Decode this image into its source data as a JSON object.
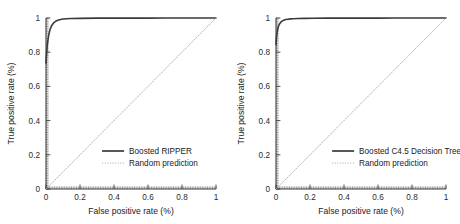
{
  "figure": {
    "background": "#ffffff",
    "panel_count": 2
  },
  "chart_data": [
    {
      "type": "line",
      "panel": "left",
      "title": "",
      "xlabel": "False positive rate (%)",
      "ylabel": "True positive rate (%)",
      "xlim": [
        0,
        1
      ],
      "ylim": [
        0,
        1
      ],
      "xticks": [
        0,
        0.2,
        0.4,
        0.6,
        0.8,
        1
      ],
      "xticklabels": [
        "0",
        "0.2",
        "0.4",
        "0.6",
        "0.8",
        "1"
      ],
      "yticks": [
        0,
        0.2,
        0.4,
        0.6,
        0.8,
        1
      ],
      "yticklabels": [
        "0",
        "0.2",
        "0.4",
        "0.6",
        "0.8",
        "1"
      ],
      "grid": false,
      "minor_ticks": true,
      "legend_position": "lower right",
      "series": [
        {
          "name": "Boosted RIPPER",
          "style": "solid",
          "color": "#3a3a3a",
          "linewidth": 1.6,
          "x": [
            0,
            0.004,
            0.008,
            0.012,
            0.016,
            0.02,
            0.025,
            0.03,
            0.035,
            0.042,
            0.05,
            0.06,
            0.07,
            0.08,
            0.1,
            0.12,
            0.15,
            0.2,
            0.3,
            0.4,
            0.5,
            0.6,
            0.7,
            0.8,
            0.9,
            1.0
          ],
          "y": [
            0.735,
            0.8,
            0.845,
            0.875,
            0.9,
            0.918,
            0.935,
            0.948,
            0.958,
            0.968,
            0.976,
            0.983,
            0.987,
            0.99,
            0.994,
            0.996,
            0.997,
            0.998,
            0.999,
            0.999,
            0.9995,
            0.9995,
            1.0,
            1.0,
            1.0,
            1.0
          ]
        },
        {
          "name": "Random prediction",
          "style": "dotted",
          "color": "#a8a8a8",
          "linewidth": 0.9,
          "x": [
            0,
            1
          ],
          "y": [
            0,
            1
          ]
        }
      ]
    },
    {
      "type": "line",
      "panel": "right",
      "title": "",
      "xlabel": "False positive rate (%)",
      "ylabel": "True positive rate (%)",
      "xlim": [
        0,
        1
      ],
      "ylim": [
        0,
        1
      ],
      "xticks": [
        0,
        0.2,
        0.4,
        0.6,
        0.8,
        1
      ],
      "xticklabels": [
        "0",
        "0.2",
        "0.4",
        "0.6",
        "0.8",
        "1"
      ],
      "yticks": [
        0,
        0.2,
        0.4,
        0.6,
        0.8,
        1
      ],
      "yticklabels": [
        "0",
        "0.2",
        "0.4",
        "0.6",
        "0.8",
        "1"
      ],
      "grid": false,
      "minor_ticks": true,
      "legend_position": "lower right",
      "series": [
        {
          "name": "Boosted C4.5 Decision Tree",
          "style": "solid",
          "color": "#3a3a3a",
          "linewidth": 1.6,
          "x": [
            0,
            0.003,
            0.006,
            0.01,
            0.014,
            0.018,
            0.024,
            0.03,
            0.038,
            0.048,
            0.058,
            0.07,
            0.085,
            0.1,
            0.13,
            0.17,
            0.22,
            0.3,
            0.4,
            0.5,
            0.6,
            0.7,
            0.8,
            0.9,
            1.0
          ],
          "y": [
            0.845,
            0.885,
            0.912,
            0.934,
            0.95,
            0.96,
            0.97,
            0.977,
            0.983,
            0.988,
            0.991,
            0.993,
            0.995,
            0.996,
            0.997,
            0.998,
            0.9985,
            0.999,
            0.999,
            0.9995,
            0.9995,
            1.0,
            1.0,
            1.0,
            1.0
          ]
        },
        {
          "name": "Random prediction",
          "style": "dotted",
          "color": "#a8a8a8",
          "linewidth": 0.9,
          "x": [
            0,
            1
          ],
          "y": [
            0,
            1
          ]
        }
      ]
    }
  ]
}
